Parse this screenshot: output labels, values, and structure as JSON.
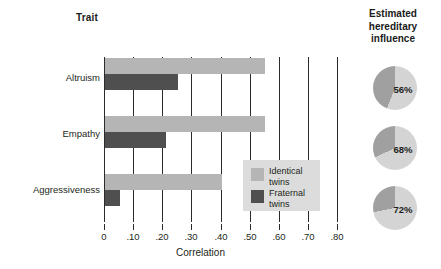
{
  "headers": {
    "trait": "Trait",
    "right_title": "Estimated hereditary influence",
    "right_title_lines": [
      "Estimated",
      "hereditary",
      "influence"
    ]
  },
  "axis": {
    "x_title": "Correlation",
    "x_ticks": [
      "0",
      ".10",
      ".20",
      ".30",
      ".40",
      ".50",
      ".60",
      ".70",
      ".80"
    ],
    "x_tick_values": [
      0,
      0.1,
      0.2,
      0.3,
      0.4,
      0.5,
      0.6,
      0.7,
      0.8
    ],
    "x_min": 0,
    "x_max": 0.8
  },
  "legend": {
    "items": [
      {
        "label_line1": "Identical",
        "label_line2": "twins",
        "label": "Identical twins",
        "color": "#b5b5b5"
      },
      {
        "label_line1": "Fraternal",
        "label_line2": "twins",
        "label": "Fraternal twins",
        "color": "#4f4f4f"
      }
    ]
  },
  "colors": {
    "identical": "#b5b5b5",
    "fraternal": "#4f4f4f",
    "pie_light": "#d4d4d4",
    "pie_dark": "#a0a0a0",
    "grid": "#2b2b2b",
    "legend_bg": "#dcdcdc"
  },
  "pies": [
    {
      "trait": "Altruism",
      "label": "56%",
      "value": 56
    },
    {
      "trait": "Empathy",
      "label": "68%",
      "value": 68
    },
    {
      "trait": "Aggressiveness",
      "label": "72%",
      "value": 72
    }
  ],
  "chart_data": {
    "type": "bar",
    "orientation": "horizontal",
    "title": "",
    "xlabel": "Correlation",
    "ylabel": "Trait",
    "categories": [
      "Altruism",
      "Empathy",
      "Aggressiveness"
    ],
    "series": [
      {
        "name": "Identical twins",
        "color": "#b5b5b5",
        "values": [
          0.55,
          0.55,
          0.4
        ]
      },
      {
        "name": "Fraternal twins",
        "color": "#4f4f4f",
        "values": [
          0.25,
          0.21,
          0.05
        ]
      }
    ],
    "xlim": [
      0,
      0.8
    ],
    "xticks": [
      0,
      0.1,
      0.2,
      0.3,
      0.4,
      0.5,
      0.6,
      0.7,
      0.8
    ],
    "xticklabels": [
      "0",
      ".10",
      ".20",
      ".30",
      ".40",
      ".50",
      ".60",
      ".70",
      ".80"
    ],
    "grid": "vertical",
    "legend_position": "inside-lower-right",
    "companion": {
      "type": "pie",
      "title": "Estimated hereditary influence",
      "units": "%",
      "items": [
        {
          "category": "Altruism",
          "value": 56,
          "label": "56%"
        },
        {
          "category": "Empathy",
          "value": 68,
          "label": "68%"
        },
        {
          "category": "Aggressiveness",
          "value": 72,
          "label": "72%"
        }
      ]
    }
  }
}
